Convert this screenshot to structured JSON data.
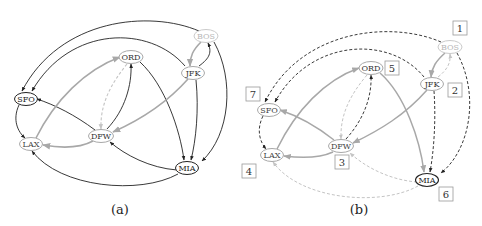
{
  "colors": {
    "dark": "#222222",
    "gray": "#a8a8a8",
    "light": "#c4c4c4",
    "bos": "#b8b8b8"
  },
  "panels": [
    {
      "id": "a",
      "caption": "(a)",
      "nodes": [
        {
          "id": "BOS",
          "label": "BOS",
          "x": 206,
          "y": 36,
          "style": "light"
        },
        {
          "id": "JFK",
          "label": "JFK",
          "x": 193,
          "y": 73,
          "style": "gray"
        },
        {
          "id": "ORD",
          "label": "ORD",
          "x": 131,
          "y": 57,
          "style": "gray"
        },
        {
          "id": "SFO",
          "label": "SFO",
          "x": 26,
          "y": 99,
          "style": "dark"
        },
        {
          "id": "DFW",
          "label": "DFW",
          "x": 101,
          "y": 136,
          "style": "gray"
        },
        {
          "id": "LAX",
          "label": "LAX",
          "x": 31,
          "y": 144,
          "style": "gray"
        },
        {
          "id": "MIA",
          "label": "MIA",
          "x": 187,
          "y": 168,
          "style": "dark"
        }
      ]
    },
    {
      "id": "b",
      "caption": "(b)",
      "nodes": [
        {
          "id": "BOS",
          "label": "BOS",
          "x": 450,
          "y": 47,
          "style": "light"
        },
        {
          "id": "JFK",
          "label": "JFK",
          "x": 432,
          "y": 84,
          "style": "gray"
        },
        {
          "id": "ORD",
          "label": "ORD",
          "x": 371,
          "y": 68,
          "style": "gray"
        },
        {
          "id": "SFO",
          "label": "SFO",
          "x": 269,
          "y": 110,
          "style": "gray"
        },
        {
          "id": "DFW",
          "label": "DFW",
          "x": 341,
          "y": 146,
          "style": "gray"
        },
        {
          "id": "LAX",
          "label": "LAX",
          "x": 272,
          "y": 155,
          "style": "gray"
        },
        {
          "id": "MIA",
          "label": "MIA",
          "x": 427,
          "y": 180,
          "style": "dark"
        }
      ],
      "order_boxes": [
        {
          "label": "1",
          "x": 460,
          "y": 28,
          "node": "BOS"
        },
        {
          "label": "2",
          "x": 455,
          "y": 90,
          "node": "JFK"
        },
        {
          "label": "3",
          "x": 342,
          "y": 162,
          "node": "DFW"
        },
        {
          "label": "4",
          "x": 249,
          "y": 171,
          "node": "LAX"
        },
        {
          "label": "5",
          "x": 392,
          "y": 68,
          "node": "ORD"
        },
        {
          "label": "6",
          "x": 446,
          "y": 194,
          "node": "MIA"
        },
        {
          "label": "7",
          "x": 253,
          "y": 94,
          "node": "SFO"
        }
      ]
    }
  ]
}
